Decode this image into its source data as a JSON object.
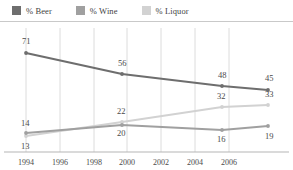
{
  "legend": {
    "items": [
      {
        "label": "% Beer",
        "color": "#6e6e6e",
        "key": "beer"
      },
      {
        "label": "% Wine",
        "color": "#a0a0a0",
        "key": "wine"
      },
      {
        "label": "% Liquor",
        "color": "#d2d2d2",
        "key": "liquor"
      }
    ]
  },
  "axis": {
    "xticks": [
      "1994",
      "1996",
      "1998",
      "2000",
      "2002",
      "2004",
      "2006"
    ]
  },
  "chart_data": {
    "type": "line",
    "title": "",
    "subtitle": "",
    "xlabel": "",
    "ylabel": "",
    "xlim": [
      1994,
      2007.5
    ],
    "ylim": [
      0,
      80
    ],
    "grid": "vertical",
    "legend_position": "top-left",
    "x": [
      1994,
      1999,
      2004,
      2007
    ],
    "series": [
      {
        "name": "% Beer",
        "key": "beer",
        "color": "#6e6e6e",
        "values": [
          71,
          56,
          48,
          45
        ],
        "labels": [
          "71",
          "56",
          "48",
          "45"
        ],
        "label_positions": [
          "above",
          "above",
          "above",
          "above"
        ]
      },
      {
        "name": "% Wine",
        "key": "wine",
        "color": "#a0a0a0",
        "values": [
          14,
          20,
          16,
          19
        ],
        "labels": [
          "14",
          "20",
          "16",
          "19"
        ],
        "label_positions": [
          "above",
          "below",
          "below",
          "below"
        ]
      },
      {
        "name": "% Liquor",
        "key": "liquor",
        "color": "#d2d2d2",
        "values": [
          13,
          22,
          32,
          33
        ],
        "labels": [
          "13",
          "22",
          "32",
          "33"
        ],
        "label_positions": [
          "below",
          "above",
          "above",
          "above"
        ]
      }
    ],
    "xticks": [
      "1994",
      "1996",
      "1998",
      "2000",
      "2002",
      "2004",
      "2006"
    ]
  },
  "points": {
    "beer": [
      {
        "x": 26,
        "y": 31,
        "label": "71",
        "lx": 22,
        "ly": 22
      },
      {
        "x": 122,
        "y": 52,
        "label": "56",
        "lx": 118,
        "ly": 44
      },
      {
        "x": 222,
        "y": 64,
        "label": "48",
        "lx": 218,
        "ly": 56
      },
      {
        "x": 268,
        "y": 68,
        "label": "45",
        "lx": 265,
        "ly": 59
      }
    ],
    "wine": [
      {
        "x": 26,
        "y": 111,
        "label": "14",
        "lx": 21,
        "ly": 104
      },
      {
        "x": 122,
        "y": 103,
        "label": "20",
        "lx": 117,
        "ly": 114
      },
      {
        "x": 222,
        "y": 108,
        "label": "16",
        "lx": 217,
        "ly": 120
      },
      {
        "x": 268,
        "y": 104,
        "label": "19",
        "lx": 265,
        "ly": 117
      }
    ],
    "liquor": [
      {
        "x": 26,
        "y": 114,
        "label": "13",
        "lx": 21,
        "ly": 127
      },
      {
        "x": 122,
        "y": 100,
        "label": "22",
        "lx": 117,
        "ly": 92
      },
      {
        "x": 222,
        "y": 85,
        "label": "32",
        "lx": 217,
        "ly": 77
      },
      {
        "x": 268,
        "y": 83,
        "label": "33",
        "lx": 265,
        "ly": 75
      }
    ]
  },
  "gridlines_x": [
    26,
    60,
    94,
    127,
    161,
    195,
    229
  ],
  "xtick_labels": [
    {
      "x": 26,
      "text": "1994"
    },
    {
      "x": 60,
      "text": "1996"
    },
    {
      "x": 94,
      "text": "1998"
    },
    {
      "x": 127,
      "text": "2000"
    },
    {
      "x": 161,
      "text": "2002"
    },
    {
      "x": 195,
      "text": "2004"
    },
    {
      "x": 229,
      "text": "2006"
    }
  ]
}
